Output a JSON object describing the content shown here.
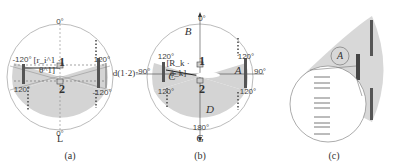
{
  "panels": [
    {
      "id": "a",
      "caption": "(a)",
      "bottom_label": "L",
      "angles": {
        "top": "0°",
        "bottom": "0°",
        "upper_left": "-120°",
        "upper_right": "120°",
        "lower_left": "120°",
        "lower_right": "-120°"
      },
      "markers": {
        "upper": "1",
        "lower": "2"
      },
      "formula": "[r_i^1 · θ^1]",
      "distance_label": "d(1·2)"
    },
    {
      "id": "b",
      "caption": "(b)",
      "bottom_label": "G",
      "angles": {
        "top": "0°",
        "bottom": "180°",
        "left": "-90°",
        "right": "90°",
        "upper_left": "120°",
        "upper_right": "120°",
        "lower_left": "120°",
        "lower_right": "120°"
      },
      "markers": {
        "upper": "1",
        "lower": "2"
      },
      "formula": "[R_k · ϕ_k]",
      "regions": [
        "A",
        "B",
        "C",
        "D"
      ]
    },
    {
      "id": "c",
      "caption": "(c)",
      "region_label": "A"
    }
  ],
  "colors": {
    "sector_fill": "#d4d4d4",
    "circle_stroke": "#999999",
    "bar": "#555555"
  }
}
